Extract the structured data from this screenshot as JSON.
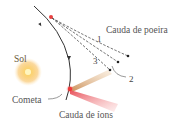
{
  "diagram": {
    "labels": {
      "dust_tail": "Cauda de poeira",
      "ion_tail": "Cauda de íons",
      "sun": "Sol",
      "comet": "Cometa"
    },
    "dust_tail_markers": [
      "1",
      "2",
      "3"
    ],
    "colors": {
      "orbit": "#333333",
      "comet": "#e8403a",
      "sun_core": "#fff3b0",
      "sun_glow": "#f6b340",
      "dust_tail": "#d9a97a",
      "ion_tail": "#ee8a8a",
      "dashed_lines": "#444444"
    }
  }
}
